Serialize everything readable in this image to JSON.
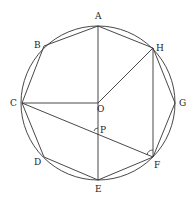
{
  "figure": {
    "type": "regular octagon inscribed in circle",
    "center": {
      "name": "O",
      "x": 98,
      "y": 103
    },
    "radius": 77,
    "vertices": [
      {
        "name": "A",
        "x": 98,
        "y": 26,
        "label_x": 95,
        "label_y": 19
      },
      {
        "name": "H",
        "x": 153,
        "y": 48,
        "label_x": 156,
        "label_y": 51
      },
      {
        "name": "G",
        "x": 175,
        "y": 103,
        "label_x": 179,
        "label_y": 106
      },
      {
        "name": "F",
        "x": 153,
        "y": 157,
        "label_x": 154,
        "label_y": 168
      },
      {
        "name": "E",
        "x": 98,
        "y": 180,
        "label_x": 95,
        "label_y": 192
      },
      {
        "name": "D",
        "x": 44,
        "y": 157,
        "label_x": 34,
        "label_y": 165
      },
      {
        "name": "C",
        "x": 22,
        "y": 103,
        "label_x": 10,
        "label_y": 106
      },
      {
        "name": "B",
        "x": 44,
        "y": 46,
        "label_x": 34,
        "label_y": 48
      }
    ],
    "points": [
      {
        "name": "O",
        "x": 98,
        "y": 103,
        "label_x": 97,
        "label_y": 112
      },
      {
        "name": "P",
        "x": 98,
        "y": 132,
        "label_x": 100,
        "label_y": 133
      }
    ],
    "segments": [
      [
        "A",
        "E"
      ],
      [
        "C",
        "O"
      ],
      [
        "O",
        "H"
      ],
      [
        "H",
        "F"
      ],
      [
        "C",
        "F"
      ]
    ],
    "angle_marks": [
      {
        "at": "P",
        "between": [
          "C",
          "E"
        ]
      },
      {
        "at": "F",
        "between": [
          "H",
          "C"
        ]
      }
    ],
    "labels": [
      "A",
      "B",
      "C",
      "D",
      "E",
      "F",
      "G",
      "H",
      "O",
      "P"
    ]
  }
}
